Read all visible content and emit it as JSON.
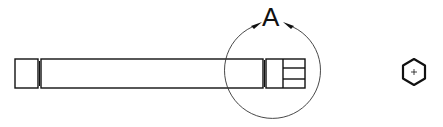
{
  "drawing": {
    "type": "technical-drawing",
    "detail_label": "A",
    "views": [
      {
        "name": "side-view",
        "description": "shaft with end cap and hex end"
      },
      {
        "name": "end-view",
        "description": "hexagon end view with center mark"
      }
    ],
    "colors": {
      "line": "#111111",
      "background": "#ffffff",
      "detail-circle": "#333333"
    }
  }
}
